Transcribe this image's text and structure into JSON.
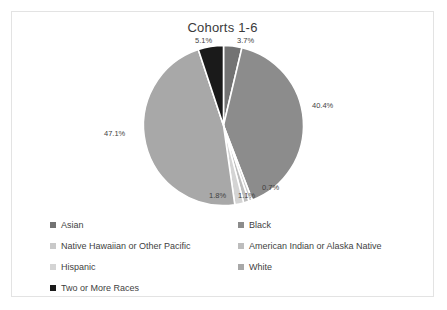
{
  "card": {
    "border_color": "#e3e3e3",
    "background": "#ffffff"
  },
  "chart_data": {
    "type": "pie",
    "title": "Cohorts 1-6",
    "xlabel": "",
    "ylabel": "",
    "legend_position": "bottom",
    "legend_columns": 2,
    "grid": false,
    "categories": [
      "Asian",
      "Black",
      "Native Hawaiian or Other Pacific",
      "American Indian or Alaska Native",
      "Hispanic",
      "White",
      "Two or More Races"
    ],
    "values": [
      3.7,
      40.4,
      0.7,
      1.1,
      1.8,
      47.1,
      5.1
    ],
    "value_labels": [
      "3.7%",
      "40.4%",
      "0.7%",
      "1.1%",
      "1.8%",
      "47.1%",
      "5.1%"
    ],
    "colors": [
      "#737373",
      "#8c8c8c",
      "#c9c9c9",
      "#bdbdbd",
      "#d4d4d4",
      "#a8a8a8",
      "#1a1a1a"
    ],
    "slice_border_color": "#ffffff",
    "start_angle_deg": 0,
    "direction": "clockwise",
    "units": "percent",
    "total": 100.0
  },
  "labels": {
    "asian": "3.7%",
    "black": "40.4%",
    "native_hawaiian": "0.7%",
    "american_indian": "1.1%",
    "hispanic": "1.8%",
    "white": "47.1%",
    "two_or_more": "5.1%"
  },
  "legend": {
    "items": [
      {
        "label": "Asian",
        "color": "#737373"
      },
      {
        "label": "Black",
        "color": "#8c8c8c"
      },
      {
        "label": "Native Hawaiian or Other Pacific",
        "color": "#c9c9c9"
      },
      {
        "label": "American Indian or Alaska Native",
        "color": "#bdbdbd"
      },
      {
        "label": "Hispanic",
        "color": "#d4d4d4"
      },
      {
        "label": "White",
        "color": "#a8a8a8"
      },
      {
        "label": "Two or More Races",
        "color": "#1a1a1a"
      }
    ]
  }
}
